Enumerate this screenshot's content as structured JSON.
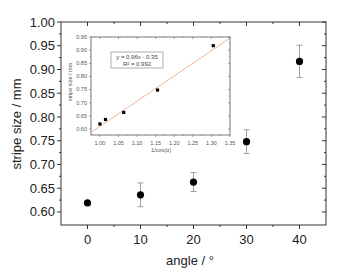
{
  "chart_data": [
    {
      "id": "main",
      "type": "scatter",
      "title": "",
      "xlabel": "angle / °",
      "ylabel": "stripe size / mm",
      "xlim": [
        -5,
        45
      ],
      "ylim": [
        0.5725,
        1.0
      ],
      "xticks": [
        0,
        10,
        20,
        30,
        40
      ],
      "xtick_labels": [
        "0",
        "10",
        "20",
        "30",
        "40"
      ],
      "yticks": [
        0.6,
        0.65,
        0.7,
        0.75,
        0.8,
        0.85,
        0.9,
        0.95,
        1.0
      ],
      "ytick_labels": [
        "0.60",
        "0.65",
        "0.70",
        "0.75",
        "0.80",
        "0.85",
        "0.90",
        "0.95",
        "1.00"
      ],
      "grid": false,
      "legend": null,
      "series": [
        {
          "name": "stripe size",
          "marker": "filled-circle",
          "color": "#000000",
          "x": [
            0,
            10,
            20,
            30,
            40
          ],
          "y": [
            0.619,
            0.636,
            0.663,
            0.748,
            0.917
          ],
          "yerr": [
            0.004,
            0.025,
            0.02,
            0.025,
            0.034
          ]
        }
      ]
    },
    {
      "id": "inset",
      "type": "scatter",
      "title": "",
      "xlabel": "1/cos(α)",
      "ylabel": "stripe size / mm",
      "xlim": [
        0.976,
        1.35
      ],
      "ylim": [
        0.577,
        0.95
      ],
      "xticks": [
        1.0,
        1.05,
        1.1,
        1.15,
        1.2,
        1.25,
        1.3,
        1.35
      ],
      "xtick_labels": [
        "1.00",
        "1.05",
        "1.10",
        "1.15",
        "1.20",
        "1.25",
        "1.30",
        "1.35"
      ],
      "yticks": [
        0.6,
        0.65,
        0.7,
        0.75,
        0.8,
        0.85,
        0.9,
        0.95
      ],
      "ytick_labels": [
        "0.60",
        "0.65",
        "0.70",
        "0.75",
        "0.80",
        "0.85",
        "0.90",
        "0.95"
      ],
      "grid": false,
      "series": [
        {
          "name": "stripe size vs 1/cos(α)",
          "marker": "filled-square",
          "color": "#000000",
          "x": [
            1.0,
            1.015,
            1.064,
            1.155,
            1.305
          ],
          "y": [
            0.619,
            0.636,
            0.663,
            0.748,
            0.917
          ]
        }
      ],
      "fit": {
        "type": "linear",
        "slope": 0.96,
        "intercept": -0.35,
        "color": "#e8a27a",
        "equation": "y = 0.96x - 0.35",
        "r2": "R² = 0.992"
      }
    }
  ]
}
